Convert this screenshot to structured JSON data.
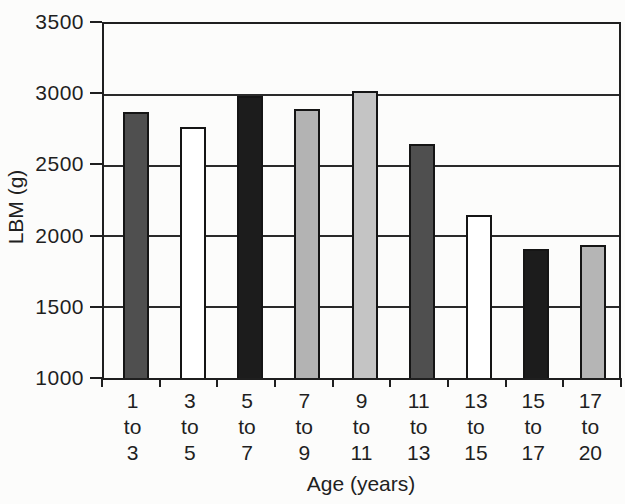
{
  "chart_data": {
    "type": "bar",
    "title": "",
    "xlabel": "Age (years)",
    "ylabel": "LBM (g)",
    "categories": [
      "1 to 3",
      "3 to 5",
      "5 to 7",
      "7 to 9",
      "9 to 11",
      "11 to 13",
      "13 to 15",
      "15 to 17",
      "17 to 20"
    ],
    "values": [
      2880,
      2770,
      2990,
      2900,
      3030,
      2650,
      2150,
      1910,
      1940
    ],
    "bar_colors": [
      "#4f4f4f",
      "#ffffff",
      "#1c1c1c",
      "#b3b3b3",
      "#c4c4c4",
      "#4f4f4f",
      "#ffffff",
      "#1c1c1c",
      "#b5b5b5"
    ],
    "bar_outline_color": "#151515",
    "axis_color": "#1f1f1f",
    "gridline_color": "#2a2a2a",
    "text_color": "#1f1f1f",
    "background_color": "#fcfcfb",
    "ylim": [
      1000,
      3500
    ],
    "yticks": [
      1000,
      1500,
      2000,
      2500,
      3000,
      3500
    ],
    "grid": true,
    "grid_horizontal_only": true,
    "legend": false
  }
}
